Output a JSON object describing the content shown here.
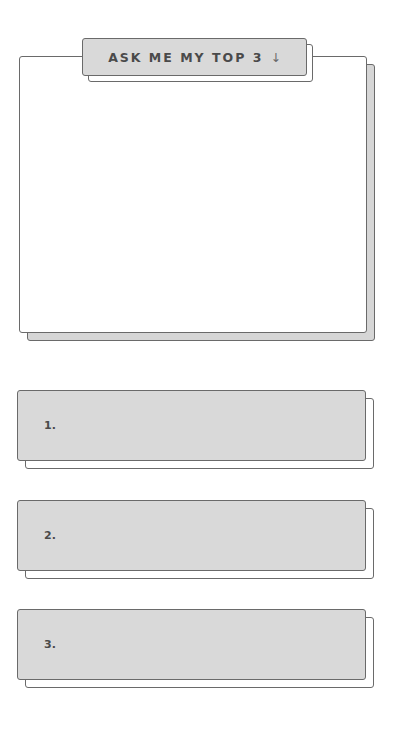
{
  "header": {
    "title": "ASK ME MY TOP 3",
    "arrow_icon": "↓"
  },
  "main_panel": {
    "content": ""
  },
  "items": [
    {
      "label": "1.",
      "value": ""
    },
    {
      "label": "2.",
      "value": ""
    },
    {
      "label": "3.",
      "value": ""
    }
  ],
  "colors": {
    "fill_gray": "#d9d9d9",
    "outline": "#6a6a6a",
    "text": "#4a4a4a",
    "background": "#ffffff"
  }
}
